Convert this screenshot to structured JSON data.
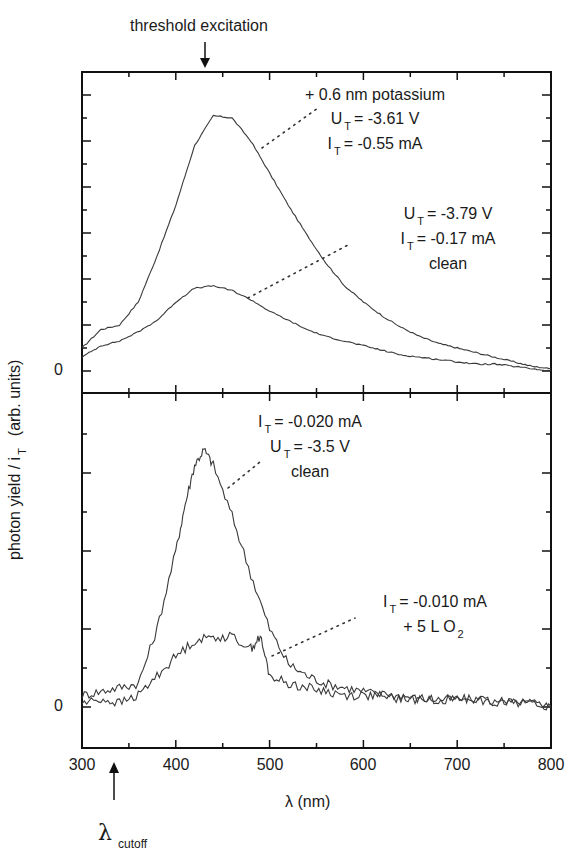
{
  "chart_data": {
    "type": "line",
    "title": "",
    "xlabel": "λ (nm)",
    "ylabel": "photon yield / i_T (arb. units)",
    "xlim": [
      300,
      800
    ],
    "x_ticks": [
      300,
      400,
      500,
      600,
      700,
      800
    ],
    "grid": false,
    "legend": "none (inline annotations)",
    "top_annotation": "threshold excitation",
    "top_annotation_x": 350,
    "bottom_annotation": "λ_cutoff",
    "bottom_annotation_x": 335,
    "panels": [
      {
        "name": "upper",
        "y_zero_label": "0",
        "ylim": [
          -1,
          12.4
        ],
        "series": [
          {
            "name": "+ 0.6 nm potassium, U_T = -3.61 V, I_T = -0.55 mA",
            "x": [
              300,
              320,
              340,
              360,
              380,
              400,
              420,
              440,
              460,
              480,
              500,
              520,
              540,
              560,
              580,
              600,
              620,
              640,
              660,
              680,
              700,
              720,
              740,
              760,
              780,
              800
            ],
            "values": [
              1.0,
              1.8,
              2.0,
              3.0,
              5.0,
              7.2,
              9.8,
              11.1,
              11.0,
              10.0,
              8.6,
              7.2,
              5.9,
              4.7,
              3.7,
              3.0,
              2.4,
              1.9,
              1.5,
              1.2,
              1.0,
              0.8,
              0.6,
              0.4,
              0.2,
              0.1
            ]
          },
          {
            "name": "clean, U_T = -3.79 V, I_T = -0.17 mA",
            "x": [
              300,
              320,
              340,
              360,
              380,
              400,
              420,
              440,
              460,
              480,
              500,
              520,
              540,
              560,
              580,
              600,
              620,
              640,
              660,
              680,
              700,
              720,
              740,
              760,
              780,
              800
            ],
            "values": [
              0.6,
              1.1,
              1.3,
              1.7,
              2.2,
              3.0,
              3.6,
              3.7,
              3.5,
              3.1,
              2.6,
              2.2,
              1.8,
              1.5,
              1.3,
              1.1,
              0.9,
              0.7,
              0.6,
              0.5,
              0.4,
              0.3,
              0.3,
              0.2,
              0.1,
              0.0
            ]
          }
        ],
        "annotations": [
          {
            "lines": [
              "+ 0.6 nm potassium",
              "U_T = -3.61 V",
              "I_T = -0.55 mA"
            ]
          },
          {
            "lines": [
              "U_T = -3.79 V",
              "I_T = -0.17 mA",
              "clean"
            ]
          }
        ]
      },
      {
        "name": "lower",
        "y_zero_label": "0",
        "ylim": [
          -1,
          7.5
        ],
        "series": [
          {
            "name": "clean, I_T = -0.020 mA, U_T = -3.5 V",
            "x": [
              300,
              320,
              340,
              360,
              380,
              400,
              410,
              420,
              430,
              440,
              460,
              480,
              500,
              520,
              540,
              560,
              580,
              600,
              620,
              640,
              660,
              680,
              700,
              720,
              740,
              760,
              780,
              800
            ],
            "values": [
              0.3,
              0.4,
              0.5,
              0.6,
              2.0,
              4.0,
              5.2,
              6.2,
              6.6,
              6.2,
              4.9,
              3.4,
              2.0,
              1.1,
              0.8,
              0.6,
              0.5,
              0.4,
              0.3,
              0.3,
              0.2,
              0.2,
              0.2,
              0.2,
              0.1,
              0.1,
              0.1,
              0.0
            ]
          },
          {
            "name": "I_T = -0.010 mA, + 5 L O2",
            "x": [
              300,
              320,
              340,
              360,
              380,
              400,
              420,
              440,
              460,
              480,
              490,
              500,
              520,
              540,
              560,
              580,
              600,
              620,
              640,
              660,
              680,
              700,
              720,
              740,
              760,
              780,
              800
            ],
            "values": [
              0.1,
              0.2,
              0.1,
              0.3,
              0.8,
              1.3,
              1.7,
              1.8,
              1.8,
              1.5,
              1.8,
              0.8,
              0.6,
              0.5,
              0.4,
              0.3,
              0.3,
              0.3,
              0.2,
              0.2,
              0.2,
              0.2,
              0.2,
              0.1,
              0.2,
              0.1,
              0.0
            ]
          }
        ],
        "annotations": [
          {
            "lines": [
              "I_T = -0.020 mA",
              "U_T = -3.5 V",
              "clean"
            ]
          },
          {
            "lines": [
              "I_T = -0.010 mA",
              "+ 5 L O2"
            ]
          }
        ]
      }
    ]
  },
  "labels": {
    "threshold": "threshold excitation",
    "xlabel": "λ (nm)",
    "ylabel_main": "photon yield / i",
    "ylabel_sub": "T",
    "ylabel_units": "(arb. units)",
    "zero_upper": "0",
    "zero_lower": "0",
    "cutoff_symbol": "λ",
    "cutoff_sub": "cutoff",
    "xticks": [
      "300",
      "400",
      "500",
      "600",
      "700",
      "800"
    ],
    "ann1": {
      "l1": "+ 0.6 nm potassium",
      "l2a": "U",
      "l2s": "T",
      "l2b": "= -3.61 V",
      "l3a": "I",
      "l3s": "T",
      "l3b": "= -0.55 mA"
    },
    "ann2": {
      "l1a": "U",
      "l1s": "T",
      "l1b": "= -3.79 V",
      "l2a": "I",
      "l2s": "T",
      "l2b": "= -0.17 mA",
      "l3": "clean"
    },
    "ann3": {
      "l1a": "I",
      "l1s": "T",
      "l1b": "= -0.020 mA",
      "l2a": "U",
      "l2s": "T",
      "l2b": "= -3.5 V",
      "l3": "clean"
    },
    "ann4": {
      "l1a": "I",
      "l1s": "T",
      "l1b": "= -0.010 mA",
      "l2a": "+ 5 L O",
      "l2s": "2"
    }
  },
  "colors": {
    "line": "#3a3a3a",
    "axis": "#111111",
    "background": "#ffffff"
  }
}
